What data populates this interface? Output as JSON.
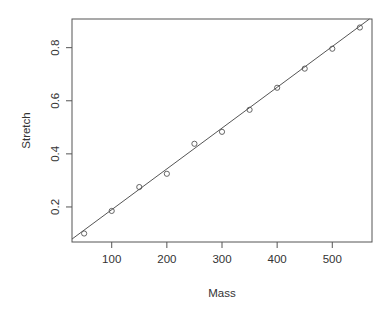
{
  "chart_data": {
    "type": "scatter",
    "title": "",
    "xlabel": "Mass",
    "ylabel": "Stretch",
    "xlim": [
      28,
      572
    ],
    "ylim": [
      0.068,
      0.908
    ],
    "xticks": [
      100,
      200,
      300,
      400,
      500
    ],
    "xtick_labels": [
      "100",
      "200",
      "300",
      "400",
      "500"
    ],
    "yticks": [
      0.2,
      0.4,
      0.6,
      0.8
    ],
    "ytick_labels": [
      "0.2",
      "0.4",
      "0.6",
      "0.8"
    ],
    "grid": false,
    "legend": null,
    "points": {
      "x": [
        50,
        100,
        150,
        200,
        250,
        300,
        350,
        400,
        450,
        500,
        550
      ],
      "y": [
        0.1,
        0.185,
        0.275,
        0.325,
        0.438,
        0.483,
        0.566,
        0.649,
        0.721,
        0.796,
        0.876
      ],
      "marker": "open-circle"
    },
    "fit_line": {
      "type": "regression",
      "intercept": 0.036,
      "slope": 0.001537
    },
    "colors": {
      "points": "#555555",
      "line": "#555555",
      "axes": "#555555"
    }
  }
}
